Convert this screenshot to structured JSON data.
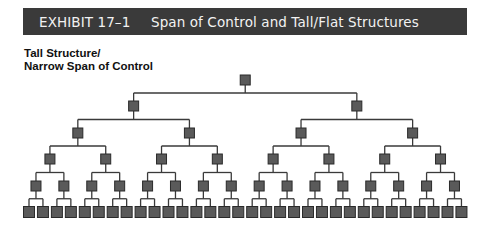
{
  "header": {
    "exhibit_label": "EXHIBIT 17–1",
    "title": "Span of Control and Tall/Flat Structures"
  },
  "diagram": {
    "subtitle_line1": "Tall Structure/",
    "subtitle_line2": "Narrow Span of Control",
    "type": "org-chart-binary-tree",
    "levels": 6,
    "span_of_control": 2,
    "nodes_per_level": [
      1,
      2,
      4,
      8,
      16,
      32
    ],
    "colors": {
      "node_fill": "#5a5a5a",
      "node_stroke": "#2a2a2a",
      "line": "#3a3a3a",
      "header_bg": "#3a3a3a",
      "header_text": "#f2f2f2"
    },
    "layout": {
      "bottom_left_x": 29,
      "bottom_pitch": 13.95,
      "level_y": [
        80,
        106,
        133,
        159,
        186,
        212
      ],
      "node_size": [
        10,
        10,
        10,
        10,
        10,
        11
      ]
    }
  }
}
